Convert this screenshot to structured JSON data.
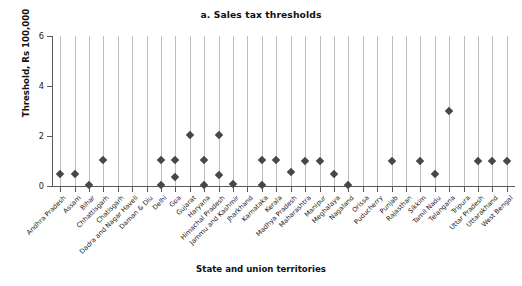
{
  "chart_data": {
    "type": "scatter",
    "title": "a. Sales tax thresholds",
    "xlabel": "State and union territories",
    "ylabel": "Threshold, Rs 100,000",
    "ylim": [
      0,
      6
    ],
    "yticks": [
      0,
      2,
      4,
      6
    ],
    "grid": "vertical",
    "legend": "none",
    "marker": "diamond",
    "marker_color": "#474747",
    "categories": [
      "Andhra Pradesh",
      "Assam",
      "Bihar",
      "Chhattisgarh",
      "Chatisgarh",
      "Dadra and Nagar Haveli",
      "Daman & Diu",
      "Delhi",
      "Goa",
      "Gujarat",
      "Haryana",
      "Himachal Pradesh",
      "Jammu and Kashmir",
      "Jharkhand",
      "Karnataka",
      "Kerala",
      "Madhya Pradesh",
      "Maharashtra",
      "Manipur",
      "Meghalaya",
      "Nagaland",
      "Orissa",
      "Puducherry",
      "Punjab",
      "Rajasthan",
      "Sikkim",
      "Tamil Nadu",
      "Telangana",
      "Tripura",
      "Uttar Pradesh",
      "Uttarakhand",
      "West Bengal"
    ],
    "points": [
      {
        "category": "Andhra Pradesh",
        "values": [
          0.5
        ]
      },
      {
        "category": "Assam",
        "values": [
          0.5
        ]
      },
      {
        "category": "Bihar",
        "values": [
          0.05
        ]
      },
      {
        "category": "Chhattisgarh",
        "values": [
          1.05
        ]
      },
      {
        "category": "Chatisgarh",
        "values": []
      },
      {
        "category": "Dadra and Nagar Haveli",
        "values": []
      },
      {
        "category": "Daman & Diu",
        "values": []
      },
      {
        "category": "Delhi",
        "values": [
          1.05,
          0.05
        ]
      },
      {
        "category": "Goa",
        "values": [
          1.05,
          0.35
        ]
      },
      {
        "category": "Gujarat",
        "values": [
          2.05
        ]
      },
      {
        "category": "Haryana",
        "values": [
          1.05,
          0.05
        ]
      },
      {
        "category": "Himachal Pradesh",
        "values": [
          2.05,
          0.45
        ]
      },
      {
        "category": "Jammu and Kashmir",
        "values": [
          0.1
        ]
      },
      {
        "category": "Jharkhand",
        "values": []
      },
      {
        "category": "Karnataka",
        "values": [
          1.05,
          0.05
        ]
      },
      {
        "category": "Kerala",
        "values": [
          1.05
        ]
      },
      {
        "category": "Madhya Pradesh",
        "values": [
          0.55
        ]
      },
      {
        "category": "Maharashtra",
        "values": [
          1.0
        ]
      },
      {
        "category": "Manipur",
        "values": [
          1.0
        ]
      },
      {
        "category": "Meghalaya",
        "values": [
          0.5
        ]
      },
      {
        "category": "Nagaland",
        "values": [
          0.05
        ]
      },
      {
        "category": "Orissa",
        "values": []
      },
      {
        "category": "Puducherry",
        "values": []
      },
      {
        "category": "Punjab",
        "values": [
          1.0
        ]
      },
      {
        "category": "Rajasthan",
        "values": []
      },
      {
        "category": "Sikkim",
        "values": [
          1.0
        ]
      },
      {
        "category": "Tamil Nadu",
        "values": [
          0.5
        ]
      },
      {
        "category": "Telangana",
        "values": [
          3.0
        ]
      },
      {
        "category": "Tripura",
        "values": []
      },
      {
        "category": "Uttar Pradesh",
        "values": [
          1.0
        ]
      },
      {
        "category": "Uttarakhand",
        "values": [
          1.0
        ]
      },
      {
        "category": "West Bengal",
        "values": [
          1.0
        ]
      }
    ]
  }
}
